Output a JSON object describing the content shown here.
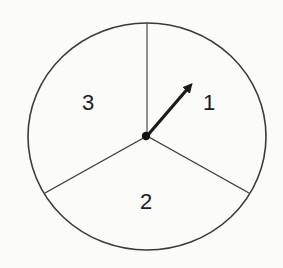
{
  "diagram": {
    "type": "spinner",
    "sections": [
      {
        "label": "1",
        "position": "upper-right"
      },
      {
        "label": "2",
        "position": "bottom"
      },
      {
        "label": "3",
        "position": "upper-left"
      }
    ],
    "arrow": {
      "points_to": "1"
    },
    "colors": {
      "stroke": "#3a3a3a",
      "arrow": "#1a1a1a",
      "background": "#fbfbfa"
    }
  }
}
